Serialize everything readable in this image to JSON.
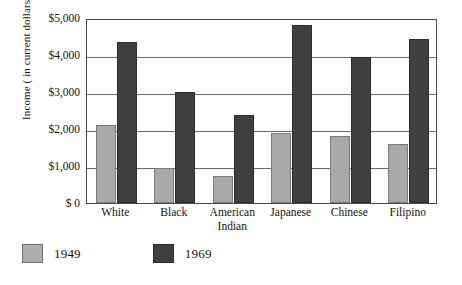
{
  "chart_data": {
    "type": "bar",
    "title": "",
    "xlabel": "",
    "ylabel": "Income ( in current dollars)",
    "ylim": [
      0,
      5000
    ],
    "ytick_labels": [
      "$5,000",
      "$4,000",
      "$3,000",
      "$2,000",
      "$1,000",
      "$ 0"
    ],
    "ytick_values": [
      5000,
      4000,
      3000,
      2000,
      1000,
      0
    ],
    "grid": true,
    "legend_position": "below-left",
    "categories": [
      "White",
      "Black",
      "American Indian",
      "Japanese",
      "Chinese",
      "Filipino"
    ],
    "series": [
      {
        "name": "1949",
        "color": "#a8a8a8",
        "values": [
          2100,
          950,
          730,
          1900,
          1800,
          1600
        ]
      },
      {
        "name": "1969",
        "color": "#3f3f3f",
        "values": [
          4350,
          3000,
          2380,
          4800,
          3950,
          4420
        ]
      }
    ]
  },
  "axis": {
    "y_title": "Income ( in current dollars)"
  },
  "legend": {
    "items": [
      {
        "label": "1949",
        "swatch": "light-gray-swatch"
      },
      {
        "label": "1969",
        "swatch": "dark-gray-swatch"
      }
    ]
  }
}
